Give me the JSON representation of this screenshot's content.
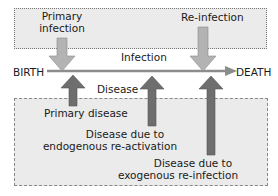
{
  "diagram": {
    "type": "timeline-process",
    "colors": {
      "box_fill": "#ebebeb",
      "timeline": "#8c8c8c",
      "infection_arrow": "#b3b3b3",
      "disease_arrow": "#6e6e6e",
      "border": "#888888"
    },
    "timeline": {
      "start_label": "BIRTH",
      "end_label": "DEATH"
    },
    "regions": {
      "infection_label": "Infection",
      "disease_label": "Disease"
    },
    "infection_events": [
      {
        "label_line1": "Primary",
        "label_line2": "infection"
      },
      {
        "label_line1": "Re-infection"
      }
    ],
    "disease_events": [
      {
        "label_line1": "Primary disease"
      },
      {
        "label_line1": "Disease due to",
        "label_line2": "endogenous re-activation"
      },
      {
        "label_line1": "Disease due to",
        "label_line2": "exogenous re-infection"
      }
    ]
  }
}
